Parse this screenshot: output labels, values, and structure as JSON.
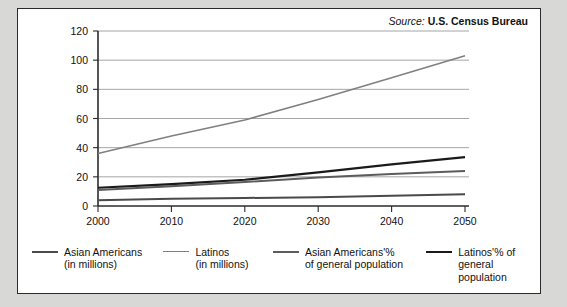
{
  "source": {
    "label": "Source:",
    "organization": "U.S. Census Bureau"
  },
  "legend": [
    {
      "name": "asian-americans-millions",
      "label": "Asian Americans\n(in millions)",
      "color": "#4a4a4a",
      "width": 2.0
    },
    {
      "name": "latinos-millions",
      "label": "Latinos\n(in millions)",
      "color": "#808080",
      "width": 1.6
    },
    {
      "name": "asian-americans-percent",
      "label": "Asian Americans'%\nof general population",
      "color": "#5c5c5c",
      "width": 2.0
    },
    {
      "name": "latinos-percent",
      "label": "Latinos'% of\ngeneral population",
      "color": "#1a1a1a",
      "width": 2.2
    }
  ],
  "chart_data": {
    "type": "line",
    "title": "",
    "xlabel": "",
    "ylabel": "",
    "x": [
      2000,
      2010,
      2020,
      2030,
      2040,
      2050
    ],
    "xtick_labels": [
      "2000",
      "2010",
      "2020",
      "2030",
      "2040",
      "2050"
    ],
    "xlim": [
      2000,
      2050
    ],
    "ytick_labels": [
      "0",
      "20",
      "40",
      "60",
      "80",
      "100",
      "120"
    ],
    "yticks": [
      0,
      20,
      40,
      60,
      80,
      100,
      120
    ],
    "ylim": [
      0,
      120
    ],
    "grid": "horizontal",
    "legend_position": "bottom",
    "series": [
      {
        "name": "Asian Americans (in millions)",
        "color": "#4a4a4a",
        "width": 2.0,
        "values": [
          4,
          5,
          5.5,
          6,
          7,
          8
        ]
      },
      {
        "name": "Latinos (in millions)",
        "color": "#808080",
        "width": 1.6,
        "values": [
          36,
          48,
          59,
          73,
          88,
          103
        ]
      },
      {
        "name": "Asian Americans'% of general population",
        "color": "#5c5c5c",
        "width": 2.0,
        "values": [
          11,
          13.5,
          16.5,
          19.5,
          22,
          24
        ]
      },
      {
        "name": "Latinos'% of general population",
        "color": "#1a1a1a",
        "width": 2.2,
        "values": [
          12.5,
          15,
          18,
          23,
          28.5,
          33.5
        ]
      }
    ]
  }
}
